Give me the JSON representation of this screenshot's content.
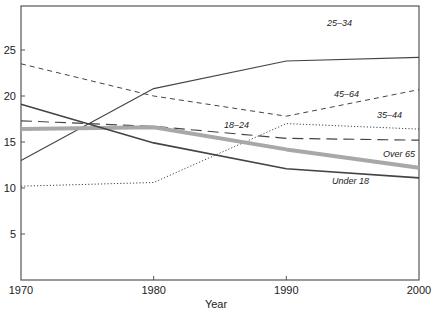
{
  "chart_data": {
    "type": "line",
    "title": "",
    "xlabel": "Year",
    "ylabel": "",
    "x": [
      1970,
      1980,
      1990,
      2000
    ],
    "xticks": [
      "1970",
      "1980",
      "1990",
      "2000"
    ],
    "yticks": [
      "5",
      "10",
      "15",
      "20",
      "25"
    ],
    "ylim": [
      0,
      29
    ],
    "grid": false,
    "legend": "inline labels",
    "series": [
      {
        "name": "25–34",
        "style": "solid-thin",
        "values": [
          13.0,
          20.8,
          23.8,
          24.2
        ],
        "label_pos": [
          327,
          26
        ]
      },
      {
        "name": "45–64",
        "style": "short-dash",
        "values": [
          23.5,
          20.0,
          17.8,
          20.7
        ],
        "label_pos": [
          334,
          97
        ]
      },
      {
        "name": "35–44",
        "style": "dotted",
        "values": [
          10.2,
          10.6,
          17.0,
          16.4
        ],
        "label_pos": [
          377,
          118
        ]
      },
      {
        "name": "18–24",
        "style": "long-dash",
        "values": [
          17.3,
          16.7,
          15.4,
          15.2
        ],
        "label_pos": [
          224,
          128
        ]
      },
      {
        "name": "Over 65",
        "style": "thick-gray",
        "values": [
          16.4,
          16.6,
          14.2,
          12.2
        ],
        "label_pos": [
          383,
          157
        ]
      },
      {
        "name": "Under 18",
        "style": "solid-dark",
        "values": [
          19.1,
          14.9,
          12.1,
          11.1
        ],
        "label_pos": [
          332,
          184
        ]
      }
    ]
  }
}
